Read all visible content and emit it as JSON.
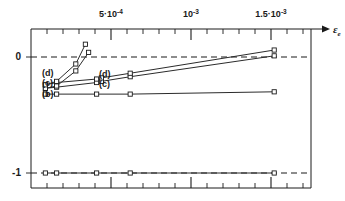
{
  "chart_data": {
    "type": "line",
    "title": "",
    "xlabel": "εₑ",
    "ylabel": "",
    "xlim": [
      0.0,
      0.00175
    ],
    "ylim": [
      -1.25,
      0.28
    ],
    "grid": false,
    "legend_position": "inline-annotations",
    "x_ticks_major": [
      0.0005,
      0.001,
      0.0015
    ],
    "x_tick_labels": [
      "5·10⁻⁴",
      "10⁻³",
      "1.5·10⁻³"
    ],
    "x_ticks_minor_step": 0.0001,
    "y_ticks": [
      0,
      -1
    ],
    "y_tick_labels": [
      "0",
      "-1"
    ],
    "reference_lines": [
      {
        "y": 0,
        "style": "dashed"
      },
      {
        "y": -1,
        "style": "dashed"
      }
    ],
    "series": [
      {
        "name": "(a)",
        "label": "(a)",
        "marker": "open-square",
        "x": [
          9e-05,
          0.00016,
          0.00041,
          0.00062,
          0.00152
        ],
        "y": [
          -1.0,
          -1.0,
          -1.0,
          -1.0,
          -1.0
        ]
      },
      {
        "name": "(b)",
        "label": "(b)",
        "marker": "open-square",
        "x": [
          9e-05,
          0.00016,
          0.00041,
          0.00062,
          0.00152
        ],
        "y": [
          -0.32,
          -0.32,
          -0.32,
          -0.32,
          -0.3
        ]
      },
      {
        "name": "(c)",
        "label": "(c)",
        "marker": "open-square",
        "x": [
          9e-05,
          0.00016,
          0.00041,
          0.00044,
          0.00062,
          0.00152
        ],
        "y": [
          -0.27,
          -0.26,
          -0.22,
          -0.21,
          -0.17,
          0.01
        ]
      },
      {
        "name": "(d)",
        "label": "(d)",
        "marker": "open-square",
        "x": [
          9e-05,
          0.00016,
          0.00041,
          0.00044,
          0.00062,
          0.00152
        ],
        "y": [
          -0.24,
          -0.22,
          -0.19,
          -0.18,
          -0.14,
          0.06
        ]
      },
      {
        "name": "(c)-rise",
        "label": "",
        "marker": "open-square",
        "x": [
          9e-05,
          0.00016,
          0.00028,
          0.00036
        ],
        "y": [
          -0.27,
          -0.25,
          -0.12,
          0.04
        ]
      },
      {
        "name": "(d)-rise",
        "label": "",
        "marker": "open-square",
        "x": [
          9e-05,
          0.00016,
          0.00028,
          0.00034
        ],
        "y": [
          -0.24,
          -0.21,
          -0.06,
          0.11
        ]
      }
    ],
    "annotations": [
      {
        "text": "(d)",
        "x_px": 42,
        "y_px": 76
      },
      {
        "text": "(c)",
        "x_px": 42,
        "y_px": 86
      },
      {
        "text": "(b)",
        "x_px": 42,
        "y_px": 97
      },
      {
        "text": "(d)",
        "x_px": 99,
        "y_px": 77
      },
      {
        "text": "(c)",
        "x_px": 99,
        "y_px": 87
      }
    ]
  },
  "axis": {
    "x_name_main": "ε",
    "x_name_sub": "e",
    "y_zero_label": "0",
    "y_minus_one_label": "-1",
    "tick_label_0": "5·10",
    "tick_label_0_exp": "-4",
    "tick_label_1": "10",
    "tick_label_1_exp": "-3",
    "tick_label_2": "1.5·10",
    "tick_label_2_exp": "-3"
  }
}
